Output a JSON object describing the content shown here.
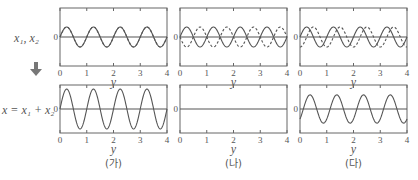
{
  "chart_data": {
    "type": "line",
    "title": "",
    "row_labels": [
      "x1, x2",
      "x = x1 + x2"
    ],
    "xlabel": "y",
    "xticks": [
      0,
      1,
      2,
      3,
      4
    ],
    "xlim": [
      0,
      4
    ],
    "yticks": [
      0
    ],
    "panels": [
      {
        "caption": "(가)",
        "phase_difference": "0 (in phase)",
        "top": {
          "series": [
            {
              "name": "x1",
              "style": "solid",
              "amplitude": 1,
              "wavelength": 1,
              "phase": 0
            },
            {
              "name": "x2",
              "style": "dashed",
              "amplitude": 1,
              "wavelength": 1,
              "phase": 0
            }
          ]
        },
        "bottom": {
          "series": [
            {
              "name": "x",
              "style": "solid",
              "amplitude": 2,
              "wavelength": 1,
              "phase": 0
            }
          ]
        }
      },
      {
        "caption": "(나)",
        "phase_difference": "π (opposite)",
        "top": {
          "series": [
            {
              "name": "x1",
              "style": "solid",
              "amplitude": 1,
              "wavelength": 1,
              "phase": 0
            },
            {
              "name": "x2",
              "style": "dashed",
              "amplitude": 1,
              "wavelength": 1,
              "phase": 3.14159
            }
          ]
        },
        "bottom": {
          "series": [
            {
              "name": "x",
              "style": "solid",
              "amplitude": 0,
              "wavelength": 1,
              "phase": 0
            }
          ]
        }
      },
      {
        "caption": "(다)",
        "phase_difference": "π/2",
        "top": {
          "series": [
            {
              "name": "x1",
              "style": "solid",
              "amplitude": 1,
              "wavelength": 1,
              "phase": 0
            },
            {
              "name": "x2",
              "style": "dashed",
              "amplitude": 1,
              "wavelength": 1,
              "phase": -1.5708
            }
          ]
        },
        "bottom": {
          "series": [
            {
              "name": "x",
              "style": "solid",
              "amplitude": 1.414,
              "wavelength": 1,
              "phase": -0.7854
            }
          ]
        }
      }
    ],
    "arrow": "down"
  },
  "labels": {
    "row_top": "x₁, x₂",
    "row_bottom": "x = x₁ + x₂",
    "zero": "0",
    "axis_var": "y"
  },
  "colors": {
    "axis": "#666666",
    "wave": "#555555",
    "arrow": "#777777"
  }
}
